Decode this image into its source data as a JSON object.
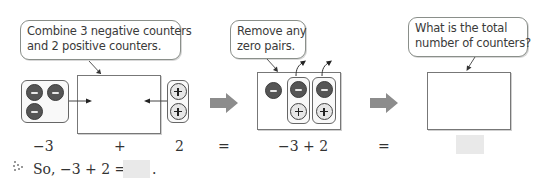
{
  "bubbles": {
    "combine": {
      "line1": "Combine 3 negative counters",
      "line2": "and 2 positive counters."
    },
    "remove": {
      "line1": "Remove any",
      "line2": "zero pairs."
    },
    "total": {
      "line1": "What is the total",
      "line2": "number of counters?"
    }
  },
  "counters": {
    "negative_group_count": 3,
    "positive_group_count": 2,
    "middle_unpaired_negatives": 1,
    "middle_zero_pairs": 2
  },
  "labels": {
    "left_operand": "−3",
    "plus": "+",
    "right_operand": "2",
    "equals_1": "=",
    "expression": "−3 + 2",
    "equals_2": "="
  },
  "conclusion": {
    "marker": "⁘",
    "text": "So, −3 + 2 =",
    "period": "."
  },
  "colors": {
    "negative_counter": "#555555",
    "positive_counter": "#e6e6e6",
    "arrow": "#8c8c8c",
    "answer_box": "#e9e9e9"
  }
}
